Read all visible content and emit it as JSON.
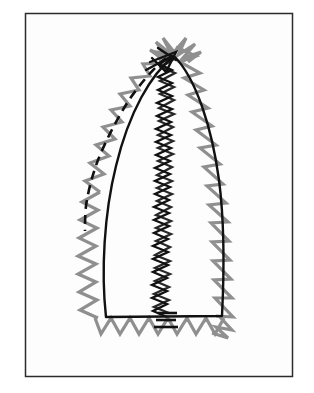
{
  "figure": {
    "title": "Scanned line figure: ogive leaf-shaped outline with overlaid zigzag traces",
    "type": "line-drawing",
    "canvas": {
      "width": 314,
      "height": 393,
      "background": "#ffffff"
    },
    "frame": {
      "name": "figure-border",
      "x": 25,
      "y": 13,
      "width": 268,
      "height": 364,
      "stroke": "#2b2b2b",
      "stroke_width": 1.5,
      "fill": "#fdfdfd"
    },
    "colors": {
      "ink_black": "#111111",
      "trace_gray": "#8a8a8a",
      "paper": "#fdfdfd",
      "border": "#2b2b2b",
      "page": "#ffffff"
    },
    "elements": [
      {
        "name": "outline-curve",
        "label": "Smooth black ogive outline",
        "stroke": "#111111",
        "stroke_width": 2.4,
        "dash": "none",
        "path": "M 174 56 C 196 78 212 128 219 180 C 225 226 224 276 222 316 L 106 317 C 101 272 104 214 116 166 C 129 112 151 74 174 56 Z"
      },
      {
        "name": "baseline-segment",
        "label": "Horizontal black base line",
        "stroke": "#111111",
        "stroke_width": 2.4,
        "dash": "none",
        "path": "M 106 317 L 222 316"
      },
      {
        "name": "dashed-left-trace",
        "label": "Black dashed trace along upper-left flank",
        "stroke": "#111111",
        "stroke_width": 2.6,
        "dash": "9 6",
        "path": "M 166 58 C 152 70 140 84 129 100 C 117 119 106 140 98 160 C 92 176 88 192 86 206 C 85 216 85 224 85 231"
      },
      {
        "name": "gray-zigzag-perimeter",
        "label": "Gray sawtooth trace following the outline perimeter",
        "stroke": "#8a8a8a",
        "stroke_width": 3.2,
        "teeth": 46,
        "amplitude": 12
      },
      {
        "name": "center-sawtooth",
        "label": "Dense black vertical sawtooth down the midline",
        "stroke": "#111111",
        "stroke_width": 2.3,
        "x_axis": 163,
        "y_start": 58,
        "y_end": 322,
        "teeth": 44,
        "amplitude": 9
      },
      {
        "name": "center-foot-marks",
        "label": "Short black marks at base of center sawtooth",
        "stroke": "#111111",
        "stroke_width": 2.6
      }
    ]
  }
}
